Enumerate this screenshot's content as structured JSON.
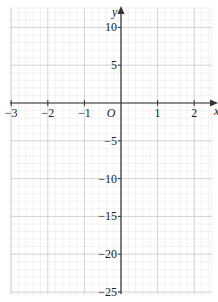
{
  "chart_data": {
    "type": "line",
    "title": "",
    "xlabel": "x",
    "ylabel": "y",
    "origin_label": "O",
    "xlim": [
      -3,
      2.2
    ],
    "ylim": [
      -25,
      12
    ],
    "x_ticks": [
      -3,
      -2,
      -1,
      1,
      2
    ],
    "x_tick_labels": [
      "−3",
      "−2",
      "−1",
      "1",
      "2"
    ],
    "y_ticks": [
      10,
      5,
      -5,
      -10,
      -15,
      -20,
      -25
    ],
    "y_tick_labels": [
      "10",
      "5",
      "−5",
      "−10",
      "−15",
      "−20",
      "−25"
    ],
    "grid": true,
    "grid_minor_x_step": 0.2,
    "grid_minor_y_step": 1,
    "series": [],
    "legend": null
  },
  "colors": {
    "grid_minor": "#e4e4e4",
    "grid_major": "#c8c8c8",
    "axis": "#333333"
  }
}
